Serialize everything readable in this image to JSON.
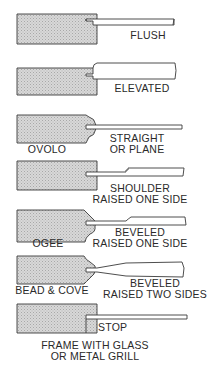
{
  "colors": {
    "stroke": "#3a3a3a",
    "stile_fill": "#cfcfcf",
    "panel_fill": "#ffffff",
    "text": "#2a2a2a"
  },
  "profiles": [
    {
      "id": "flush",
      "label": "FLUSH"
    },
    {
      "id": "elevated",
      "label": "ELEVATED"
    },
    {
      "id": "ovolo",
      "stile_label": "OVOLO",
      "panel_label_line1": "STRAIGHT",
      "panel_label_line2": "OR PLANE"
    },
    {
      "id": "shoulder",
      "label_line1": "SHOULDER",
      "label_line2": "RAISED ONE SIDE"
    },
    {
      "id": "ogee",
      "stile_label": "OGEE",
      "panel_label_line1": "BEVELED",
      "panel_label_line2": "RAISED ONE SIDE"
    },
    {
      "id": "bead-cove",
      "stile_label": "BEAD & COVE",
      "panel_label_line1": "BEVELED",
      "panel_label_line2": "RAISED TWO SIDES"
    },
    {
      "id": "stop",
      "label": "STOP",
      "caption_line1": "FRAME WITH GLASS",
      "caption_line2": "OR METAL GRILL"
    }
  ]
}
